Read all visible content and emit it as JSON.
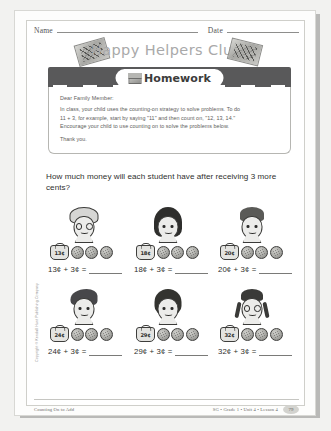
{
  "header": {
    "name_label": "Name",
    "date_label": "Date",
    "title": "Happy Helpers Club",
    "stamp_left": "stamp-graphic",
    "stamp_right": "stamp-graphic"
  },
  "banner": {
    "label": "Homework",
    "icon": "homework-book-icon"
  },
  "note": {
    "greeting": "Dear Family Member:",
    "line1": "In class, your child uses the counting-on strategy to solve problems. To do",
    "line2": "11 + 3, for example, start by saying \"11\" and then count on, \"12, 13, 14.\"",
    "line3": "Encourage your child to use counting on to solve the problems below.",
    "closing": "Thank you."
  },
  "question": "How much money will each student have after receiving 3 more cents?",
  "problems": [
    {
      "id": "problem-1",
      "student": "student-curly-glasses",
      "hair": "curly",
      "glasses": true,
      "purse_amount": "13¢",
      "coins": 3,
      "equation_left": "13¢ + 3¢ ="
    },
    {
      "id": "problem-2",
      "student": "student-long-hair",
      "hair": "long",
      "glasses": false,
      "purse_amount": "18¢",
      "coins": 3,
      "equation_left": "18¢ + 3¢ ="
    },
    {
      "id": "problem-3",
      "student": "student-short-hair",
      "hair": "short",
      "glasses": false,
      "purse_amount": "20¢",
      "coins": 3,
      "equation_left": "20¢ + 3¢ ="
    },
    {
      "id": "problem-4",
      "student": "student-swoop-hair",
      "hair": "swoop",
      "glasses": false,
      "purse_amount": "24¢",
      "coins": 3,
      "equation_left": "24¢ + 3¢ ="
    },
    {
      "id": "problem-5",
      "student": "student-bob-hair",
      "hair": "bob",
      "glasses": false,
      "purse_amount": "29¢",
      "coins": 3,
      "equation_left": "29¢ + 3¢ ="
    },
    {
      "id": "problem-6",
      "student": "student-braids-glasses",
      "hair": "braids",
      "glasses": true,
      "purse_amount": "32¢",
      "coins": 3,
      "equation_left": "32¢ + 3¢ ="
    }
  ],
  "side_copyright": "Copyright © Kendall Hunt Publishing Company",
  "footer": {
    "lesson_title": "Counting On to Add",
    "meta": "SG • Grade 1 • Unit 4 • Lesson 4",
    "page_number": "79"
  },
  "colors": {
    "banner_bar": "#59595a",
    "title_gray": "#a9a9a9",
    "body_text": "#2f2f2e",
    "note_text": "#5d5d5b",
    "paper": "#ffffff"
  }
}
